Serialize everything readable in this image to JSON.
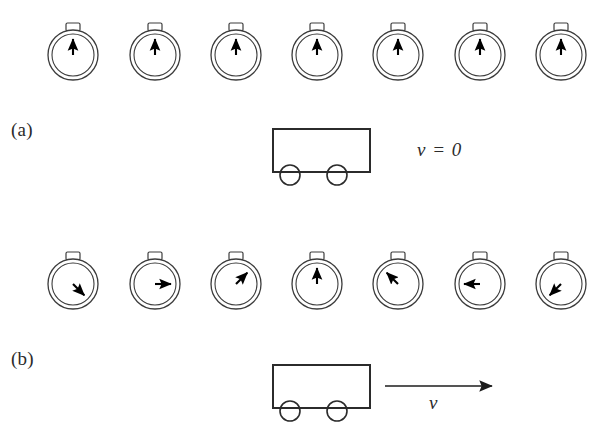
{
  "figure": {
    "top_caption_fragment": "",
    "panels": [
      {
        "id": "a",
        "label": "(a)",
        "clock_row_y": 55,
        "clocks": [
          {
            "center_x": 73,
            "hand_angle_deg": 0,
            "reads": "12 o'clock"
          },
          {
            "center_x": 155,
            "hand_angle_deg": 0,
            "reads": "12 o'clock"
          },
          {
            "center_x": 236,
            "hand_angle_deg": 0,
            "reads": "12 o'clock"
          },
          {
            "center_x": 317,
            "hand_angle_deg": 0,
            "reads": "12 o'clock"
          },
          {
            "center_x": 398,
            "hand_angle_deg": 0,
            "reads": "12 o'clock"
          },
          {
            "center_x": 480,
            "hand_angle_deg": 0,
            "reads": "12 o'clock"
          },
          {
            "center_x": 561,
            "hand_angle_deg": 0,
            "reads": "12 o'clock"
          }
        ],
        "cart": {
          "x": 273,
          "y": 129,
          "width": 97,
          "height": 43
        },
        "velocity_label": "v = 0",
        "velocity_arrow": false
      },
      {
        "id": "b",
        "label": "(b)",
        "clock_row_y": 284,
        "clocks": [
          {
            "center_x": 73,
            "hand_angle_deg": 135,
            "reads": "4:30"
          },
          {
            "center_x": 155,
            "hand_angle_deg": 90,
            "reads": "3:00"
          },
          {
            "center_x": 236,
            "hand_angle_deg": 45,
            "reads": "1:30"
          },
          {
            "center_x": 317,
            "hand_angle_deg": 0,
            "reads": "12:00"
          },
          {
            "center_x": 398,
            "hand_angle_deg": -45,
            "reads": "10:30"
          },
          {
            "center_x": 480,
            "hand_angle_deg": -90,
            "reads": "9:00"
          },
          {
            "center_x": 561,
            "hand_angle_deg": 225,
            "reads": "7:30"
          }
        ],
        "cart": {
          "x": 273,
          "y": 365,
          "width": 97,
          "height": 43
        },
        "velocity_label": "v",
        "velocity_arrow": true,
        "arrow": {
          "x1": 385,
          "x2": 492,
          "y": 386
        }
      }
    ],
    "clock_style": {
      "outer_radius": 25,
      "inner_radius": 21,
      "hand_length": 16,
      "crown_width": 14,
      "crown_height": 8,
      "stroke_color": "#3c3c3c",
      "hand_color": "#000000",
      "fill_color": "#ffffff"
    },
    "cart_style": {
      "wheel_radius": 10,
      "stroke_color": "#2b2b2b",
      "fill_color": "#ffffff"
    }
  }
}
